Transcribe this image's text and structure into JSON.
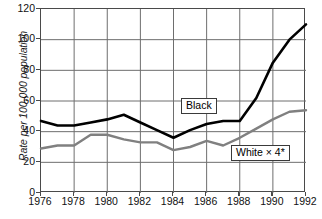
{
  "axes": {
    "y_title": "Rate per 100,000 population",
    "y_ticks": [
      "0",
      "20",
      "40",
      "60",
      "80",
      "100",
      "120"
    ],
    "x_ticks": [
      "1976",
      "1978",
      "1980",
      "1982",
      "1984",
      "1986",
      "1988",
      "1990",
      "1992"
    ]
  },
  "labels": {
    "black": "Black",
    "white": "White × 4*"
  },
  "colors": {
    "black_series": "#000000",
    "white_series": "#808080",
    "grid": "#6e6e6e",
    "frame": "#4a4a4a"
  },
  "chart_data": {
    "type": "line",
    "title": "",
    "xlabel": "",
    "ylabel": "Rate per 100,000 population",
    "xlim": [
      1976,
      1992
    ],
    "ylim": [
      0,
      120
    ],
    "grid": true,
    "legend": "inline-callouts",
    "x": [
      1976,
      1977,
      1978,
      1979,
      1980,
      1981,
      1982,
      1983,
      1984,
      1985,
      1986,
      1987,
      1988,
      1989,
      1990,
      1991,
      1992
    ],
    "xtick_values": [
      1976,
      1978,
      1980,
      1982,
      1984,
      1986,
      1988,
      1990,
      1992
    ],
    "ytick_values": [
      0,
      20,
      40,
      60,
      80,
      100,
      120
    ],
    "series": [
      {
        "name": "Black",
        "color": "#000000",
        "values": [
          47,
          44,
          44,
          46,
          48,
          51,
          46,
          41,
          36,
          41,
          45,
          47,
          47,
          62,
          85,
          100,
          110
        ]
      },
      {
        "name": "White × 4*",
        "color": "#808080",
        "values": [
          29,
          31,
          31,
          38,
          38,
          35,
          33,
          33,
          28,
          30,
          34,
          31,
          36,
          42,
          48,
          53,
          54
        ]
      }
    ],
    "annotations": [
      {
        "text": "Black",
        "x": 1985,
        "y": 62
      },
      {
        "text": "White × 4*",
        "x": 1989,
        "y": 27
      }
    ],
    "footnote_marker": "*"
  }
}
